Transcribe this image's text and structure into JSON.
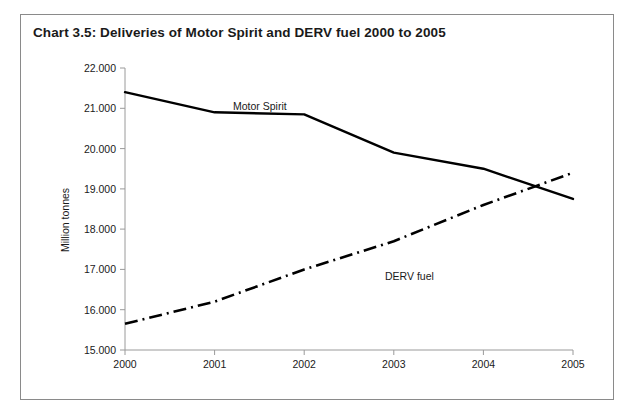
{
  "chart_data": {
    "type": "line",
    "title": "Chart 3.5:  Deliveries of Motor Spirit and DERV fuel 2000 to 2005",
    "xlabel": "",
    "ylabel": "Million tonnes",
    "x": [
      "2000",
      "2001",
      "2002",
      "2003",
      "2004",
      "2005"
    ],
    "xtick_labels": [
      "2000",
      "2001",
      "2002",
      "2003",
      "2004",
      "2005"
    ],
    "ytick_labels": [
      "15.000",
      "16.000",
      "17.000",
      "18.000",
      "19.000",
      "20.000",
      "21.000",
      "22.000"
    ],
    "ylim": [
      15.0,
      22.0
    ],
    "ytick_step": 1.0,
    "grid": false,
    "legend_position": "inline-annotation",
    "series": [
      {
        "name": "Motor Spirit",
        "style": "solid",
        "color": "#000000",
        "values": [
          21.4,
          20.9,
          20.85,
          19.9,
          19.5,
          18.75
        ],
        "label_x": "2001",
        "label_value": 21.25
      },
      {
        "name": "DERV fuel",
        "style": "dash-dot",
        "color": "#000000",
        "values": [
          15.65,
          16.2,
          17.0,
          17.7,
          18.6,
          19.4
        ],
        "label_x": "2003",
        "label_value": 17.1
      }
    ],
    "annotations": [
      {
        "text": "Motor Spirit",
        "x_px": 212,
        "y_px": 95
      },
      {
        "text": "DERV fuel",
        "x_px": 364,
        "y_px": 265
      }
    ]
  },
  "axis": {
    "y_title": "Million tonnes",
    "y_ticks": [
      "22.000",
      "21.000",
      "20.000",
      "19.000",
      "18.000",
      "17.000",
      "16.000",
      "15.000"
    ],
    "x_ticks": [
      "2000",
      "2001",
      "2002",
      "2003",
      "2004",
      "2005"
    ]
  },
  "labels": {
    "series_motor_spirit": "Motor Spirit",
    "series_derv_fuel": "DERV fuel"
  },
  "colors": {
    "frame_border": "#8a8a8a",
    "axis": "#9a9a9a",
    "line": "#000000",
    "text": "#1a1a1a",
    "background": "#ffffff"
  }
}
